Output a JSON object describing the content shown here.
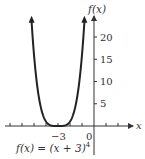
{
  "chart_data": {
    "type": "line",
    "title": "",
    "function_label": "f(x) = (x + 3)",
    "function_exponent": "4",
    "xlabel": "x",
    "ylabel": "f(x)",
    "x_ticks": [
      -7,
      -6,
      -5,
      -4,
      -3,
      -2,
      -1,
      1,
      2
    ],
    "x_tick_labels": [
      {
        "value": -3,
        "label": "−3"
      },
      {
        "value": 0,
        "label": "0"
      }
    ],
    "y_ticks": [
      5,
      10,
      15,
      20
    ],
    "y_tick_labels": [
      "5",
      "10",
      "15",
      "20"
    ],
    "xlim": [
      -7.3,
      3.2
    ],
    "ylim": [
      0,
      24
    ],
    "series": [
      {
        "name": "f(x) = (x + 3)^4",
        "x": [
          -5.2,
          -5.0,
          -4.8,
          -4.6,
          -4.4,
          -4.2,
          -4.0,
          -3.8,
          -3.6,
          -3.4,
          -3.2,
          -3.0,
          -2.8,
          -2.6,
          -2.4,
          -2.2,
          -2.0,
          -1.8,
          -1.6,
          -1.4,
          -1.2,
          -1.0,
          -0.8
        ],
        "y": [
          23.43,
          16.0,
          10.5,
          6.55,
          3.84,
          2.07,
          1.0,
          0.41,
          0.13,
          0.026,
          0.0016,
          0,
          0.0016,
          0.026,
          0.13,
          0.41,
          1.0,
          2.07,
          3.84,
          6.55,
          10.5,
          16.0,
          23.43
        ]
      }
    ],
    "vertex": {
      "x": -3,
      "y": 0
    },
    "grid": false,
    "arrows_on_curve_ends": true
  }
}
